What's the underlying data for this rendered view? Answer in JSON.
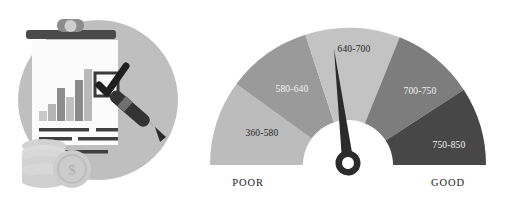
{
  "illustration": {
    "name": "credit-report-clipboard-illustration",
    "backdrop_circle_color": "#bfbfbf",
    "paper_color": "#fbfbfb",
    "clip_bar_color": "#4a4a4a",
    "pen_color": "#333333",
    "coin_color": "#d2d2d2",
    "bar_chart": {
      "bars": [
        {
          "height": 10,
          "color": "#c9c9c9"
        },
        {
          "height": 17,
          "color": "#b5b5b5"
        },
        {
          "height": 33,
          "color": "#8e8e8e"
        },
        {
          "height": 24,
          "color": "#c0c0c0"
        },
        {
          "height": 41,
          "color": "#8a8a8a"
        },
        {
          "height": 52,
          "color": "#b9b9b9"
        }
      ]
    },
    "text_lines": 4,
    "checkbox_checked": true
  },
  "gauge": {
    "title": "credit-score-gauge",
    "needle_value_label": "640-700",
    "needle_angle_deg": -7,
    "hub_color": "#2b2b2b",
    "needle_color": "#2b2b2b",
    "inner_disc_color": "#ffffff",
    "segments": [
      {
        "label": "360-580",
        "color": "#bcbcbc",
        "text_tone": "dark",
        "start_deg": 180,
        "end_deg": 144
      },
      {
        "label": "580-640",
        "color": "#9a9a9a",
        "text_tone": "light",
        "start_deg": 144,
        "end_deg": 108
      },
      {
        "label": "640-700",
        "color": "#c3c3c3",
        "text_tone": "dark",
        "start_deg": 108,
        "end_deg": 68
      },
      {
        "label": "700-750",
        "color": "#7d7d7d",
        "text_tone": "light",
        "start_deg": 68,
        "end_deg": 33
      },
      {
        "label": "750-850",
        "color": "#474747",
        "text_tone": "light",
        "start_deg": 33,
        "end_deg": 0
      }
    ],
    "end_labels": {
      "left": "POOR",
      "right": "GOOD"
    }
  }
}
